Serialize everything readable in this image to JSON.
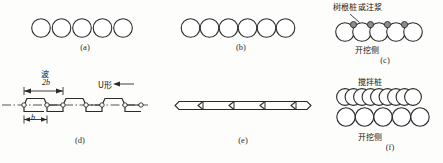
{
  "figure": {
    "title": "",
    "stroke_color": "#2a2a2a",
    "fill_color": "#ffffff",
    "node_fill": "#8d8d8d",
    "background": "#fdfdfb"
  },
  "panels": [
    {
      "id": "a",
      "caption": "(a)",
      "type": "separated-circles",
      "circle_count": 5,
      "circle_diameter": 19,
      "spacing": 20.5,
      "labels": []
    },
    {
      "id": "b",
      "caption": "(b)",
      "type": "tangent-circles",
      "circle_count": 6,
      "circle_diameter": 19,
      "spacing": 19,
      "labels": []
    },
    {
      "id": "c",
      "caption": "(c)",
      "type": "overlapping-circles-with-nodes",
      "circle_count": 5,
      "circle_diameter": 19,
      "spacing": 17,
      "node_count": 4,
      "labels": [
        {
          "text": "树根桩或注浆",
          "role": "annotation-top"
        },
        {
          "text": "开挖侧",
          "role": "annotation-bottom"
        }
      ]
    },
    {
      "id": "d",
      "caption": "(d)",
      "type": "sheet-pile-wave-profile",
      "wave_count": 3,
      "labels": [
        {
          "text": "波",
          "role": "wave-label"
        },
        {
          "text": "2b",
          "role": "dimension-full-wave"
        },
        {
          "text": "b",
          "role": "dimension-half-wave"
        },
        {
          "text": "U形",
          "role": "u-shape-callout"
        }
      ]
    },
    {
      "id": "e",
      "caption": "(e)",
      "type": "sheet-pile-plan-strip",
      "joint_count": 4,
      "labels": []
    },
    {
      "id": "f",
      "caption": "(f)",
      "type": "double-row-mixing-piles",
      "top_circle_count": 9,
      "bottom_circle_count": 5,
      "labels": [
        {
          "text": "搅拌桩",
          "role": "annotation-top"
        },
        {
          "text": "开挖侧",
          "role": "annotation-bottom"
        }
      ]
    }
  ],
  "captions": {
    "a": "(a)",
    "b": "(b)",
    "c": "(c)",
    "d": "(d)",
    "e": "(e)",
    "f": "(f)"
  },
  "annotations": {
    "root_pile_or_grouting": "树根桩或注浆",
    "excavation_side_c": "开挖侧",
    "mixing_pile": "搅拌桩",
    "excavation_side_f": "开挖侧",
    "wave": "波",
    "dim_2b": "2b",
    "dim_b": "b",
    "u_shape": "U形"
  }
}
